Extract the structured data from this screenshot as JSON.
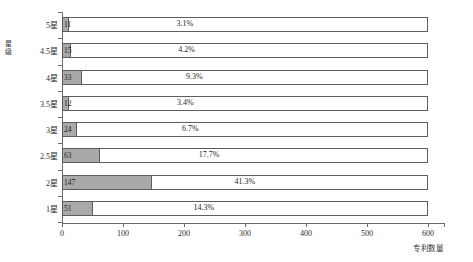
{
  "chart_data": {
    "type": "bar",
    "orientation": "horizontal",
    "title": "",
    "xlabel": "专利数量",
    "ylabel": "星级",
    "categories": [
      "5星",
      "4.5星",
      "4星",
      "3.5星",
      "3星",
      "2.5星",
      "2星",
      "1星"
    ],
    "values": [
      11,
      15,
      33,
      12,
      24,
      63,
      147,
      51
    ],
    "value_labels": [
      "11",
      "15",
      "33",
      "12",
      "24",
      "63",
      "147",
      "51"
    ],
    "percent_labels": [
      "3.1%",
      "4.2%",
      "9.3%",
      "3.4%",
      "6.7%",
      "17.7%",
      "41.3%",
      "14.3%"
    ],
    "percents": [
      3.1,
      4.2,
      9.3,
      3.4,
      6.7,
      17.7,
      41.3,
      14.3
    ],
    "xlim": [
      0,
      600
    ],
    "xticks": [
      0,
      100,
      200,
      300,
      400,
      500,
      600
    ],
    "xtick_labels": [
      "0",
      "100",
      "200",
      "300",
      "400",
      "500",
      "600"
    ],
    "grid": false,
    "legend": "none",
    "bar_fill_color": "#a9a9a9",
    "bar_border_color": "#5d5d5d",
    "outline_bar_max": 600,
    "axis_color": "#6b6b6b",
    "text_color": "#1d1d1d"
  }
}
